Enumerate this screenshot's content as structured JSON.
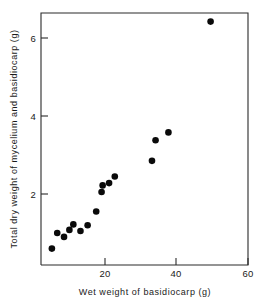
{
  "chart_data": {
    "type": "scatter",
    "title": "",
    "xlabel": "Wet weight of basidiocarp (g)",
    "ylabel": "Total dry weight of mycelium and basidiocarp (g)",
    "xlim": [
      0,
      60
    ],
    "ylim": [
      0,
      6.9
    ],
    "xticks": [
      20,
      40,
      60
    ],
    "xticklabels": [
      "20",
      "40",
      "60"
    ],
    "yticks": [
      2,
      4,
      6
    ],
    "yticklabels": [
      "2",
      "4",
      "6"
    ],
    "grid": false,
    "legend": null,
    "marker": "filled-circle",
    "marker_color": "#0a0a0a",
    "points": [
      {
        "x": 5.0,
        "y": 0.6
      },
      {
        "x": 6.5,
        "y": 1.0
      },
      {
        "x": 8.4,
        "y": 0.9
      },
      {
        "x": 9.9,
        "y": 1.08
      },
      {
        "x": 11.0,
        "y": 1.22
      },
      {
        "x": 13.0,
        "y": 1.05
      },
      {
        "x": 15.0,
        "y": 1.2
      },
      {
        "x": 17.4,
        "y": 1.55
      },
      {
        "x": 18.9,
        "y": 2.05
      },
      {
        "x": 19.2,
        "y": 2.22
      },
      {
        "x": 21.0,
        "y": 2.28
      },
      {
        "x": 22.6,
        "y": 2.45
      },
      {
        "x": 33.0,
        "y": 2.85
      },
      {
        "x": 34.0,
        "y": 3.38
      },
      {
        "x": 37.6,
        "y": 3.58
      },
      {
        "x": 49.4,
        "y": 6.42
      }
    ]
  },
  "axes": {
    "x_label": "Wet weight of basidiocarp (g)",
    "y_label": "Total dry weight of mycelium and basidiocarp (g)",
    "x_tick_labels": [
      "20",
      "40",
      "60"
    ],
    "y_tick_labels": [
      "2",
      "4",
      "6"
    ]
  }
}
